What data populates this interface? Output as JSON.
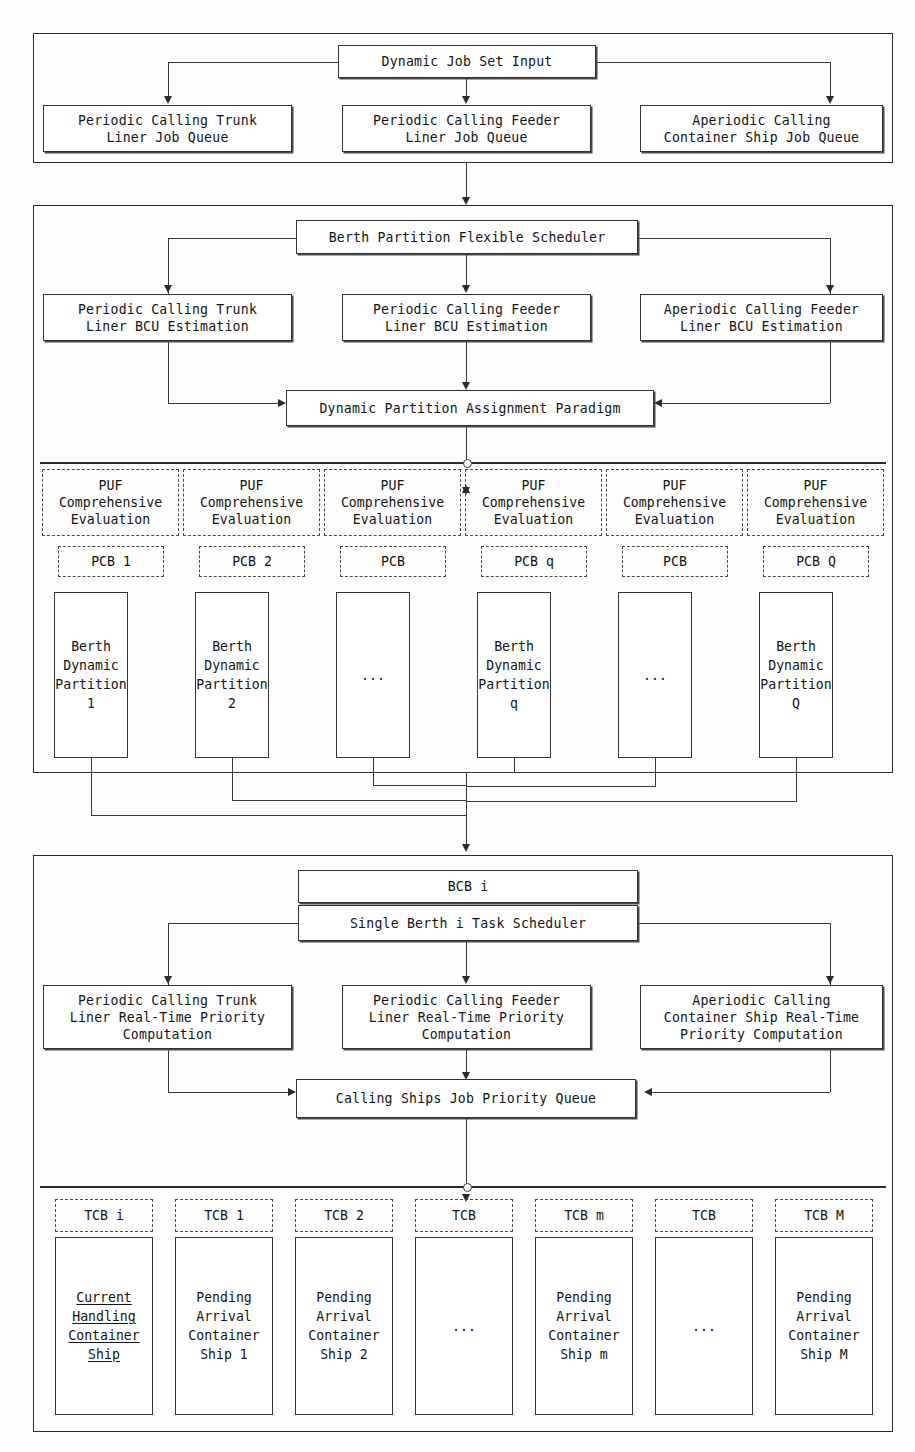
{
  "diagram": {
    "sections": [
      {
        "id": "job-input",
        "name": "Dynamic Job Set Input Layer"
      },
      {
        "id": "berth-partition",
        "name": "Berth Partition Flexible Scheduling Layer"
      },
      {
        "id": "single-berth",
        "name": "Single Berth Task Scheduling Layer"
      }
    ]
  },
  "section1": {
    "root": "Dynamic Job Set Input",
    "queues": [
      "Periodic Calling Trunk\nLiner Job Queue",
      "Periodic Calling Feeder\nLiner Job Queue",
      "Aperiodic Calling\nContainer Ship Job Queue"
    ]
  },
  "section2": {
    "root": "Berth Partition Flexible Scheduler",
    "estimations": [
      "Periodic Calling Trunk\nLiner BCU Estimation",
      "Periodic Calling Feeder\nLiner BCU Estimation",
      "Aperiodic Calling Feeder\nLiner BCU Estimation"
    ],
    "paradigm": "Dynamic Partition Assignment Paradigm",
    "puf_label": "PUF\nComprehensive\nEvaluation",
    "puf_cells": [
      "PUF\nComprehensive\nEvaluation",
      "PUF\nComprehensive\nEvaluation",
      "PUF\nComprehensive\nEvaluation",
      "PUF\nComprehensive\nEvaluation",
      "PUF\nComprehensive\nEvaluation",
      "PUF\nComprehensive\nEvaluation"
    ],
    "pcb_labels": [
      "PCB 1",
      "PCB 2",
      "PCB",
      "PCB q",
      "PCB",
      "PCB Q"
    ],
    "partitions": [
      "Berth\nDynamic\nPartition\n1",
      "Berth\nDynamic\nPartition\n2",
      "",
      "Berth\nDynamic\nPartition\nq",
      "",
      "Berth\nDynamic\nPartition\nQ"
    ],
    "partition_ellipsis": [
      "",
      "",
      "...",
      "",
      "...",
      ""
    ]
  },
  "section3": {
    "bcb": "BCB i",
    "scheduler": "Single Berth i Task Scheduler",
    "priority_computations": [
      "Periodic Calling Trunk\nLiner Real-Time Priority\nComputation",
      "Periodic Calling Feeder\nLiner Real-Time Priority\nComputation",
      "Aperiodic Calling\nContainer Ship Real-Time\nPriority Computation"
    ],
    "queue": "Calling Ships Job Priority Queue",
    "tcb_labels": [
      "TCB i",
      "TCB 1",
      "TCB 2",
      "TCB",
      "TCB m",
      "TCB",
      "TCB M"
    ],
    "ships": [
      "Current\nHandling\nContainer\nShip",
      "Pending\nArrival\nContainer\nShip 1",
      "Pending\nArrival\nContainer\nShip 2",
      "",
      "Pending\nArrival\nContainer\nShip m",
      "",
      "Pending\nArrival\nContainer\nShip M"
    ],
    "ship_ellipsis": [
      "",
      "",
      "",
      "...",
      "",
      "...",
      ""
    ],
    "current_ship_underlined": true
  },
  "colors": {
    "line": "#3a3a3a",
    "frame": "#2b2b2b",
    "text": "#141414",
    "background": "#fdfdfc"
  }
}
